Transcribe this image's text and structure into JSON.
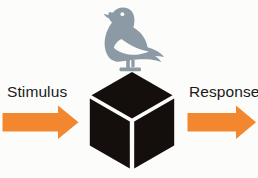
{
  "figure": {
    "background_color": "#fcfcfa"
  },
  "labels": {
    "stimulus": "Stimulus",
    "response": "Response",
    "text_color": "#1a1a1a"
  },
  "arrows": {
    "input": {
      "name": "stimulus-arrow",
      "direction": "right",
      "color": "#f3872f"
    },
    "output": {
      "name": "response-arrow",
      "direction": "right",
      "color": "#f3872f"
    }
  },
  "black_box": {
    "name": "black-box-cube",
    "shape": "isometric-cube",
    "fill_color": "#140f0d",
    "edge_color": "#fcfcfa"
  },
  "organism": {
    "name": "pigeon-icon",
    "species": "pigeon",
    "facing": "left",
    "color": "#8c9aa6",
    "eye_color": "#fcfcfa"
  },
  "icons": {
    "pigeon": "pigeon-icon",
    "cube": "cube-icon",
    "arrow_right": "arrow-right-icon"
  }
}
